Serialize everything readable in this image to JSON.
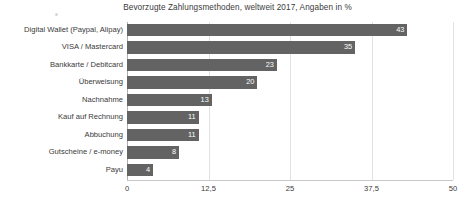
{
  "chart_data": {
    "type": "bar",
    "orientation": "horizontal",
    "title": "Bevorzugte Zahlungsmethoden, weltweit 2017, Angaben in %",
    "xlabel": "",
    "ylabel": "",
    "xlim": [
      0,
      50
    ],
    "grid": true,
    "legend": false,
    "xticks": [
      "0",
      "12,5",
      "25",
      "37,5",
      "50"
    ],
    "xtick_values": [
      0,
      12.5,
      25,
      37.5,
      50
    ],
    "categories": [
      "Digital Wallet (Paypal, Alipay)",
      "VISA / Mastercard",
      "Bankkarte / Debitcard",
      "Überweisung",
      "Nachnahme",
      "Kauf auf Rechnung",
      "Abbuchung",
      "Gutscheine / e-money",
      "Payu"
    ],
    "values": [
      43,
      35,
      23,
      20,
      13,
      11,
      11,
      8,
      4
    ],
    "value_labels": [
      "43",
      "35",
      "23",
      "20",
      "13",
      "11",
      "11",
      "8",
      "4"
    ],
    "bar_color": "#636363",
    "value_label_color": "#ffffff",
    "grid_color": "#e2e2e2",
    "background_color": "#ffffff",
    "text_color": "#3a3a3a"
  }
}
